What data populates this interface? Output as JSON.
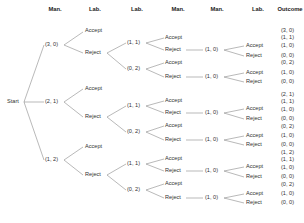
{
  "headers": [
    "Man.",
    "Lab.",
    "Lab.",
    "Man.",
    "Man.",
    "Lab.",
    "Outcome"
  ],
  "start_label": "Start",
  "branches": [
    {
      "offer": "(3, 0)",
      "accept": "Accept",
      "reject": "Reject",
      "counter_hi": "(1, 1)",
      "counter_lo": "(0, 2)",
      "hi_accept": "Accept",
      "hi_reject": "Reject",
      "hi_final": "(1, 0)",
      "hi_final_accept": "Accept",
      "hi_final_reject": "Reject",
      "lo_accept": "Accept",
      "lo_reject": "Reject",
      "lo_final": "(1, 0)",
      "lo_final_accept": "Accept",
      "lo_final_reject": "Reject",
      "outcomes": [
        "(3, 0)",
        "(1, 1)",
        "(1, 0)",
        "(0, 0)",
        "(0, 2)",
        "(1, 0)",
        "(0, 0)"
      ]
    },
    {
      "offer": "(2, 1)",
      "accept": "Accept",
      "reject": "Reject",
      "counter_hi": "(1, 1)",
      "counter_lo": "(0, 2)",
      "hi_accept": "Accept",
      "hi_reject": "Reject",
      "hi_final": "(1, 0)",
      "hi_final_accept": "Accept",
      "hi_final_reject": "Reject",
      "lo_accept": "Accept",
      "lo_reject": "Reject",
      "lo_final": "(1, 0)",
      "lo_final_accept": "Accept",
      "lo_final_reject": "Reject",
      "outcomes": [
        "(2, 1)",
        "(1, 1)",
        "(1, 0)",
        "(0, 0)",
        "(0, 2)",
        "(1, 0)",
        "(0, 0)"
      ]
    },
    {
      "offer": "(1, 2)",
      "accept": "Accept",
      "reject": "Reject",
      "counter_hi": "(1, 1)",
      "counter_lo": "(0, 2)",
      "hi_accept": "Accept",
      "hi_reject": "Reject",
      "hi_final": "(1, 0)",
      "hi_final_accept": "Accept",
      "hi_final_reject": "Reject",
      "lo_accept": "Accept",
      "lo_reject": "Reject",
      "lo_final": "(1, 0)",
      "lo_final_accept": "Accept",
      "lo_final_reject": "Reject",
      "outcomes": [
        "(1, 2)",
        "(1, 1)",
        "(1, 0)",
        "(0, 0)",
        "(0, 2)",
        "(1, 0)",
        "(0, 0)"
      ]
    }
  ]
}
